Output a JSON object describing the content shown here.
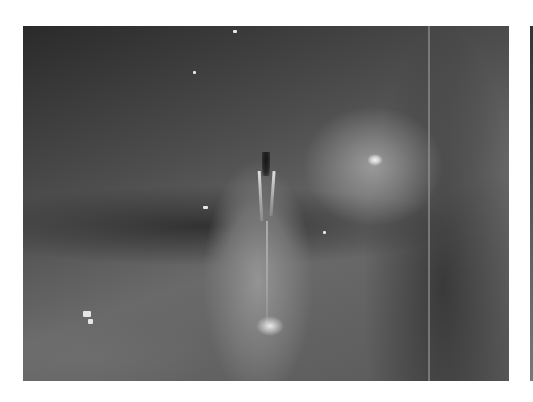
{
  "image": {
    "description": "Grayscale laryngoscopy view of the larynx showing vocal folds and surrounding tissue",
    "colors": {
      "background": "#ffffff",
      "tissue_dark": "#2a2a2a",
      "tissue_mid": "#6a6a6a",
      "highlight": "#f4f4f4"
    }
  }
}
